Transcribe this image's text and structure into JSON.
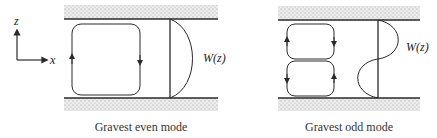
{
  "axes": {
    "z_label": "z",
    "x_label": "x"
  },
  "panels": [
    {
      "id": "even",
      "caption": "Gravest even mode",
      "profile_label": "W(z)"
    },
    {
      "id": "odd",
      "caption": "Gravest odd mode",
      "profile_label": "W(z)"
    }
  ],
  "colors": {
    "line": "#2a2a2a",
    "stipple": "#c8c8c8"
  }
}
